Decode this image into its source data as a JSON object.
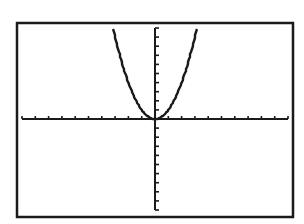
{
  "chart_data": {
    "type": "line",
    "title": "",
    "xlabel": "",
    "ylabel": "",
    "function": "y = x^2",
    "xlim": [
      -10,
      10
    ],
    "ylim": [
      -10,
      10
    ],
    "xscl": 1,
    "yscl": 1,
    "grid": false,
    "legend": "none",
    "series": [
      {
        "name": "Y1",
        "x": [
          -3.2,
          -3,
          -2.5,
          -2,
          -1.5,
          -1,
          -0.5,
          0,
          0.5,
          1,
          1.5,
          2,
          2.5,
          3,
          3.2
        ],
        "values": [
          10.24,
          9,
          6.25,
          4,
          2.25,
          1,
          0.25,
          0,
          0.25,
          1,
          2.25,
          4,
          6.25,
          9,
          10.24
        ]
      }
    ]
  }
}
